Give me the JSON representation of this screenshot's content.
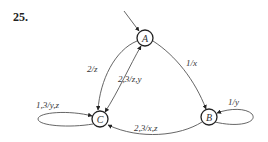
{
  "problem_number": "25.",
  "diagram": {
    "type": "finite-state-machine",
    "start_state": "A",
    "nodes": [
      {
        "id": "A",
        "label": "A",
        "cx": 145,
        "cy": 38
      },
      {
        "id": "B",
        "label": "B",
        "cx": 209,
        "cy": 117
      },
      {
        "id": "C",
        "label": "C",
        "cx": 100,
        "cy": 119
      }
    ],
    "edges": [
      {
        "from": "A",
        "to": "C",
        "label": "2/z"
      },
      {
        "from": "C",
        "to": "A",
        "label": "2,3/z,y"
      },
      {
        "from": "A",
        "to": "B",
        "label": "1/x"
      },
      {
        "from": "B",
        "to": "B",
        "label": "1/y"
      },
      {
        "from": "C",
        "to": "C",
        "label": "1,3/y,z"
      },
      {
        "from": "B",
        "to": "C",
        "label": "2,3/x,z"
      }
    ]
  },
  "colors": {
    "line": "#555555",
    "node_stroke": "#222222",
    "text": "#333333"
  }
}
